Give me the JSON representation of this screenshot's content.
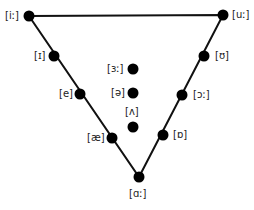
{
  "diagram": {
    "line_color": "#111111",
    "dot_color": "#000000",
    "triangle": {
      "top_left": [
        29,
        16
      ],
      "top_right": [
        223,
        15
      ],
      "bottom": [
        139,
        177
      ]
    },
    "vowels": [
      {
        "label": "[iː]",
        "x": 29,
        "y": 16,
        "lx": 5,
        "ly": 10
      },
      {
        "label": "[uː]",
        "x": 223,
        "y": 15,
        "lx": 232,
        "ly": 9
      },
      {
        "label": "[ɪ]",
        "x": 54,
        "y": 56,
        "lx": 34,
        "ly": 50
      },
      {
        "label": "[ʊ]",
        "x": 204,
        "y": 56,
        "lx": 215,
        "ly": 50
      },
      {
        "label": "[e]",
        "x": 80,
        "y": 94,
        "lx": 59,
        "ly": 88
      },
      {
        "label": "[ɔː]",
        "x": 182,
        "y": 95,
        "lx": 193,
        "ly": 89
      },
      {
        "label": "[æ]",
        "x": 112,
        "y": 138,
        "lx": 87,
        "ly": 132
      },
      {
        "label": "[ɒ]",
        "x": 163,
        "y": 135,
        "lx": 173,
        "ly": 129
      },
      {
        "label": "[ɑː]",
        "x": 139,
        "y": 177,
        "lx": 129,
        "ly": 188
      },
      {
        "label": "[ɜː]",
        "x": 133,
        "y": 69,
        "lx": 107,
        "ly": 63
      },
      {
        "label": "[ə]",
        "x": 133,
        "y": 93,
        "lx": 111,
        "ly": 87
      },
      {
        "label": "[ʌ]",
        "x": 133,
        "y": 127,
        "lx": 125,
        "ly": 106
      }
    ]
  }
}
